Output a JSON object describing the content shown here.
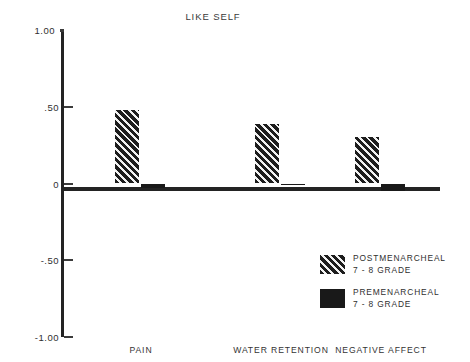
{
  "chart_data": {
    "type": "bar",
    "title": "LIKE SELF",
    "xlabel": "",
    "ylabel": "",
    "ylim": [
      -1.0,
      1.0
    ],
    "ytick_labels": [
      "1.00",
      ".50",
      "0",
      "-.50",
      "-1.00"
    ],
    "ytick_values": [
      1.0,
      0.5,
      0,
      -0.5,
      -1.0
    ],
    "grid": false,
    "legend_position": "bottom-right",
    "categories": [
      "PAIN",
      "WATER RETENTION",
      "NEGATIVE AFFECT"
    ],
    "series": [
      {
        "name": "POSTMENARCHEAL 7 - 8 GRADE",
        "fill": "hatch",
        "color": "#1d1d1d",
        "values": [
          0.48,
          0.39,
          0.3
        ]
      },
      {
        "name": "PREMENARCHEAL 7 - 8 GRADE",
        "fill": "solid",
        "color": "#191919",
        "values": [
          -0.03,
          -0.005,
          -0.05
        ]
      }
    ],
    "axis_color": "#232323",
    "background": "#ffffff"
  },
  "legend": {
    "entries": [
      {
        "line1": "POSTMENARCHEAL",
        "line2": "7 - 8 GRADE"
      },
      {
        "line1": "PREMENARCHEAL",
        "line2": "7 - 8 GRADE"
      }
    ]
  }
}
